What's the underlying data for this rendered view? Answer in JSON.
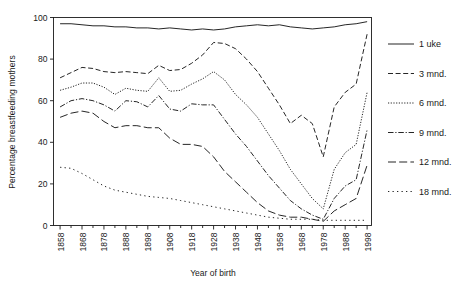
{
  "chart_data": {
    "type": "line",
    "title": "",
    "xlabel": "Year of birth",
    "ylabel": "Percentage breastfeeding mothers",
    "xlim": [
      1855,
      2000
    ],
    "ylim": [
      0,
      100
    ],
    "grid": false,
    "legend_position": "right",
    "xticks": [
      1858,
      1868,
      1878,
      1888,
      1898,
      1908,
      1918,
      1928,
      1938,
      1948,
      1958,
      1968,
      1978,
      1988,
      1998
    ],
    "yticks": [
      0,
      20,
      40,
      60,
      80,
      100
    ],
    "x": [
      1858,
      1863,
      1868,
      1873,
      1878,
      1883,
      1888,
      1893,
      1898,
      1903,
      1908,
      1913,
      1918,
      1923,
      1928,
      1933,
      1938,
      1943,
      1948,
      1953,
      1958,
      1963,
      1968,
      1973,
      1978,
      1983,
      1988,
      1993,
      1998
    ],
    "series": [
      {
        "name": "1 uke",
        "style": "solid",
        "values": [
          97,
          97,
          96.5,
          96,
          96,
          95.5,
          95.5,
          95,
          95,
          94.5,
          95,
          94.5,
          94,
          94.5,
          94,
          94.5,
          95.5,
          96,
          96.5,
          96,
          96.5,
          95.5,
          95,
          94.5,
          95,
          95.5,
          96.5,
          97,
          98
        ]
      },
      {
        "name": "3 mnd.",
        "style": "dashed",
        "values": [
          71,
          73.5,
          76,
          75.5,
          74,
          73.5,
          74,
          73.5,
          73,
          77,
          74.5,
          75,
          78,
          82,
          88,
          87.5,
          85,
          80,
          74,
          66,
          58,
          49,
          53,
          49,
          33,
          57,
          64,
          68,
          92
        ]
      },
      {
        "name": "6 mnd.",
        "style": "dotted",
        "values": [
          65,
          66.5,
          68.5,
          68.5,
          66.5,
          63,
          66,
          65,
          64.5,
          71,
          64.5,
          65,
          68,
          70.5,
          74,
          70,
          63,
          58,
          52,
          44,
          36,
          27,
          20,
          13,
          8,
          27,
          35,
          39,
          64
        ]
      },
      {
        "name": "9 mnd.",
        "style": "dashdot",
        "values": [
          57,
          60,
          61,
          60,
          58,
          55,
          60,
          59.5,
          57,
          62.5,
          56,
          55,
          58.5,
          58,
          58,
          51,
          44,
          38,
          31,
          24,
          18,
          12,
          8,
          5,
          3,
          13,
          19,
          22,
          46
        ]
      },
      {
        "name": "12 mnd.",
        "style": "longdash",
        "values": [
          52,
          54,
          55,
          54,
          50,
          47,
          48,
          48,
          47,
          47,
          42,
          39,
          39,
          38,
          33,
          26,
          21,
          16,
          11,
          7,
          5,
          4,
          4,
          3,
          2,
          7,
          10,
          13,
          29
        ]
      },
      {
        "name": "18 mnd.",
        "style": "sparsedot",
        "values": [
          28,
          27.5,
          25,
          22,
          19,
          17,
          16,
          15,
          14,
          13.5,
          13,
          12,
          11,
          10,
          9,
          8,
          7,
          6,
          5,
          4,
          3.5,
          3,
          3,
          3,
          2.5,
          2.5,
          2.5,
          2.5,
          2.5
        ]
      }
    ]
  },
  "legend": {
    "items": [
      {
        "label": "1 uke"
      },
      {
        "label": "3 mnd."
      },
      {
        "label": "6 mnd."
      },
      {
        "label": "9 mnd."
      },
      {
        "label": "12 mnd."
      },
      {
        "label": "18 mnd."
      }
    ]
  },
  "axes": {
    "ylabel": "Percentage breastfeeding mothers",
    "xlabel": "Year of birth",
    "ytick_labels": [
      "0",
      "20",
      "40",
      "60",
      "80",
      "100"
    ],
    "xtick_labels": [
      "1858",
      "1868",
      "1878",
      "1888",
      "1898",
      "1908",
      "1918",
      "1928",
      "1938",
      "1948",
      "1958",
      "1968",
      "1978",
      "1988",
      "1998"
    ]
  },
  "colors": {
    "line": "#1a1a1a",
    "axis": "#1a1a1a",
    "background": "#ffffff"
  }
}
